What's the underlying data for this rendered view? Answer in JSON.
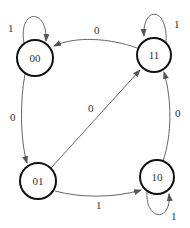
{
  "diagram": {
    "type": "state-transition",
    "nodes": [
      {
        "id": "00",
        "label": "00",
        "cx": 35,
        "cy": 58,
        "r": 18
      },
      {
        "id": "11",
        "label": "11",
        "cx": 154,
        "cy": 55,
        "r": 17
      },
      {
        "id": "01",
        "label": "01",
        "cx": 38,
        "cy": 181,
        "r": 18
      },
      {
        "id": "10",
        "label": "10",
        "cx": 157,
        "cy": 177,
        "r": 17
      }
    ],
    "edges": [
      {
        "from": "00",
        "to": "00",
        "label": "1"
      },
      {
        "from": "11",
        "to": "11",
        "label": "1"
      },
      {
        "from": "10",
        "to": "10",
        "label": "1"
      },
      {
        "from": "11",
        "to": "00",
        "label": "0"
      },
      {
        "from": "00",
        "to": "01",
        "label": "0"
      },
      {
        "from": "01",
        "to": "11",
        "label": "0"
      },
      {
        "from": "01",
        "to": "10",
        "label": "1"
      },
      {
        "from": "10",
        "to": "11",
        "label": "0"
      }
    ],
    "colors": {
      "node_stroke": "#111111",
      "edge": "#666666",
      "text": "#333333"
    }
  }
}
